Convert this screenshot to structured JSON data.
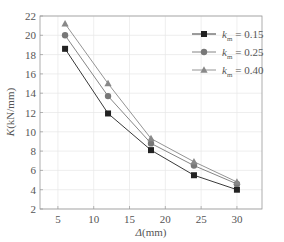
{
  "chart_data": {
    "type": "line",
    "title": "",
    "xlabel": "Δ(mm)",
    "ylabel": "K(kN/mm)",
    "x": [
      6,
      12,
      18,
      24,
      30
    ],
    "xlim": [
      2.5,
      33.5
    ],
    "ylim": [
      2,
      22
    ],
    "xticks": [
      5,
      10,
      15,
      20,
      25,
      30
    ],
    "yticks": [
      2,
      4,
      6,
      8,
      10,
      12,
      14,
      16,
      18,
      20,
      22
    ],
    "grid": true,
    "legend_position": "upper right",
    "series": [
      {
        "name": "k_m = 0.15",
        "label_var": "k",
        "label_sub": "m",
        "label_val": "= 0.15",
        "marker": "square",
        "color": "#222222",
        "values": [
          18.6,
          11.9,
          8.1,
          5.5,
          4.0
        ]
      },
      {
        "name": "k_m = 0.25",
        "label_var": "k",
        "label_sub": "m",
        "label_val": "= 0.25",
        "marker": "circle",
        "color": "#777777",
        "values": [
          20.0,
          13.7,
          8.8,
          6.5,
          4.6
        ]
      },
      {
        "name": "k_m = 0.40",
        "label_var": "k",
        "label_sub": "m",
        "label_val": "= 0.40",
        "marker": "triangle",
        "color": "#888888",
        "values": [
          21.2,
          15.0,
          9.3,
          6.9,
          4.8
        ]
      }
    ]
  }
}
